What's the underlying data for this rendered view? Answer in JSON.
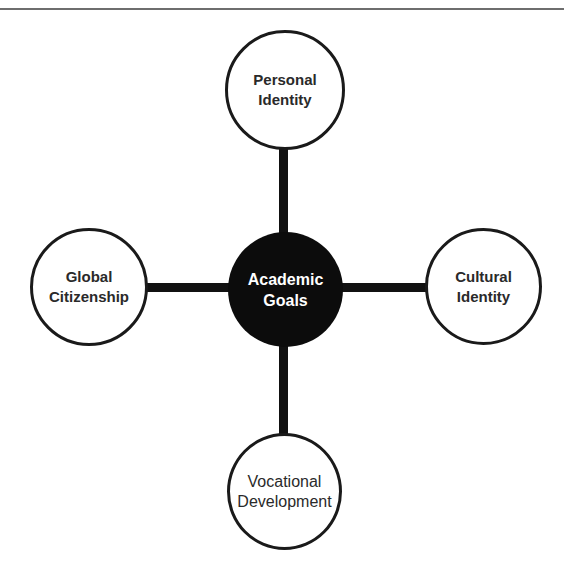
{
  "diagram": {
    "type": "hub-and-spoke",
    "center": {
      "line1": "Academic",
      "line2": "Goals",
      "fill": "#0c0c0c",
      "text_color": "#ffffff"
    },
    "nodes": {
      "top": {
        "line1": "Personal",
        "line2": "Identity"
      },
      "left": {
        "line1": "Global",
        "line2": "Citizenship"
      },
      "right": {
        "line1": "Cultural",
        "line2": "Identity"
      },
      "bottom": {
        "line1": "Vocational",
        "line2": "Development"
      }
    },
    "colors": {
      "outline": "#1a1a1a",
      "connector": "#111111",
      "node_fill": "#ffffff",
      "rule": "#6e6e6e"
    }
  }
}
